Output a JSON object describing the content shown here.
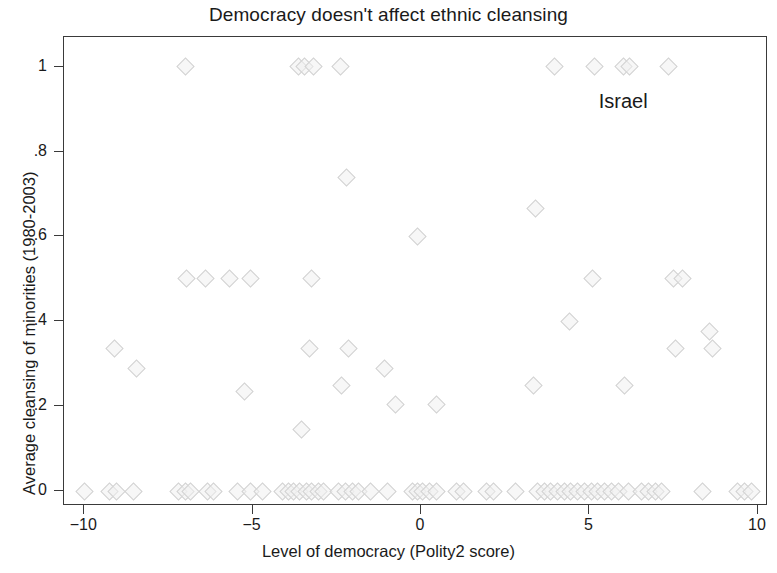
{
  "chart_data": {
    "type": "scatter",
    "title": "Democracy doesn't affect ethnic cleansing",
    "xlabel": "Level of democracy (Polity2 score)",
    "ylabel": "Average cleansing of minorities (1980-2003)",
    "xlim": [
      -10.6,
      10.3
    ],
    "ylim": [
      -0.035,
      1.07
    ],
    "xticks": [
      -10,
      -5,
      0,
      5,
      10
    ],
    "xticklabels": [
      "−10",
      "−5",
      "0",
      "5",
      "10"
    ],
    "yticks": [
      0,
      0.2,
      0.4,
      0.6,
      0.8,
      1
    ],
    "yticklabels": [
      "0",
      ".2",
      ".4",
      ".6",
      ".8",
      "1"
    ],
    "grid": false,
    "legend": null,
    "marker": "diamond",
    "marker_color": "#d2d2d2",
    "annotations": [
      {
        "text": "Israel",
        "x": 6.0,
        "y": 0.92
      }
    ],
    "points": [
      {
        "x": -7.0,
        "y": 1.0
      },
      {
        "x": -3.65,
        "y": 1.0
      },
      {
        "x": -3.45,
        "y": 1.0
      },
      {
        "x": -3.2,
        "y": 1.0
      },
      {
        "x": -2.4,
        "y": 1.0
      },
      {
        "x": 3.95,
        "y": 1.0
      },
      {
        "x": 5.15,
        "y": 1.0
      },
      {
        "x": 6.0,
        "y": 1.0
      },
      {
        "x": 6.2,
        "y": 1.0
      },
      {
        "x": 7.35,
        "y": 1.0
      },
      {
        "x": -2.2,
        "y": 0.74
      },
      {
        "x": 3.4,
        "y": 0.665
      },
      {
        "x": -0.1,
        "y": 0.6
      },
      {
        "x": -6.95,
        "y": 0.5
      },
      {
        "x": -6.4,
        "y": 0.5
      },
      {
        "x": -5.7,
        "y": 0.5
      },
      {
        "x": -5.05,
        "y": 0.5
      },
      {
        "x": -3.25,
        "y": 0.5
      },
      {
        "x": 5.1,
        "y": 0.5
      },
      {
        "x": 7.5,
        "y": 0.5
      },
      {
        "x": 7.75,
        "y": 0.5
      },
      {
        "x": 4.4,
        "y": 0.4
      },
      {
        "x": 8.55,
        "y": 0.375
      },
      {
        "x": -9.1,
        "y": 0.335
      },
      {
        "x": -3.3,
        "y": 0.335
      },
      {
        "x": -2.15,
        "y": 0.335
      },
      {
        "x": 7.55,
        "y": 0.335
      },
      {
        "x": 8.65,
        "y": 0.335
      },
      {
        "x": -8.45,
        "y": 0.29
      },
      {
        "x": -1.1,
        "y": 0.29
      },
      {
        "x": -2.35,
        "y": 0.25
      },
      {
        "x": 3.35,
        "y": 0.25
      },
      {
        "x": 6.05,
        "y": 0.25
      },
      {
        "x": -5.25,
        "y": 0.235
      },
      {
        "x": -0.75,
        "y": 0.205
      },
      {
        "x": 0.45,
        "y": 0.205
      },
      {
        "x": -3.55,
        "y": 0.145
      },
      {
        "x": -10.0,
        "y": 0.0
      },
      {
        "x": -9.25,
        "y": 0.0
      },
      {
        "x": -9.05,
        "y": 0.0
      },
      {
        "x": -8.55,
        "y": 0.0
      },
      {
        "x": -7.2,
        "y": 0.0
      },
      {
        "x": -7.0,
        "y": 0.0
      },
      {
        "x": -6.85,
        "y": 0.0
      },
      {
        "x": -6.35,
        "y": 0.0
      },
      {
        "x": -6.15,
        "y": 0.0
      },
      {
        "x": -5.45,
        "y": 0.0
      },
      {
        "x": -5.05,
        "y": 0.0
      },
      {
        "x": -4.7,
        "y": 0.0
      },
      {
        "x": -4.1,
        "y": 0.0
      },
      {
        "x": -3.95,
        "y": 0.0
      },
      {
        "x": -3.8,
        "y": 0.0
      },
      {
        "x": -3.6,
        "y": 0.0
      },
      {
        "x": -3.4,
        "y": 0.0
      },
      {
        "x": -3.25,
        "y": 0.0
      },
      {
        "x": -3.05,
        "y": 0.0
      },
      {
        "x": -2.9,
        "y": 0.0
      },
      {
        "x": -2.45,
        "y": 0.0
      },
      {
        "x": -2.25,
        "y": 0.0
      },
      {
        "x": -2.05,
        "y": 0.0
      },
      {
        "x": -1.85,
        "y": 0.0
      },
      {
        "x": -1.5,
        "y": 0.0
      },
      {
        "x": -1.0,
        "y": 0.0
      },
      {
        "x": -0.25,
        "y": 0.0
      },
      {
        "x": -0.1,
        "y": 0.0
      },
      {
        "x": 0.05,
        "y": 0.0
      },
      {
        "x": 0.25,
        "y": 0.0
      },
      {
        "x": 0.45,
        "y": 0.0
      },
      {
        "x": 1.05,
        "y": 0.0
      },
      {
        "x": 1.25,
        "y": 0.0
      },
      {
        "x": 1.95,
        "y": 0.0
      },
      {
        "x": 2.15,
        "y": 0.0
      },
      {
        "x": 2.8,
        "y": 0.0
      },
      {
        "x": 3.45,
        "y": 0.0
      },
      {
        "x": 3.65,
        "y": 0.0
      },
      {
        "x": 3.85,
        "y": 0.0
      },
      {
        "x": 4.05,
        "y": 0.0
      },
      {
        "x": 4.25,
        "y": 0.0
      },
      {
        "x": 4.45,
        "y": 0.0
      },
      {
        "x": 4.65,
        "y": 0.0
      },
      {
        "x": 4.85,
        "y": 0.0
      },
      {
        "x": 5.05,
        "y": 0.0
      },
      {
        "x": 5.25,
        "y": 0.0
      },
      {
        "x": 5.45,
        "y": 0.0
      },
      {
        "x": 5.65,
        "y": 0.0
      },
      {
        "x": 5.85,
        "y": 0.0
      },
      {
        "x": 6.15,
        "y": 0.0
      },
      {
        "x": 6.55,
        "y": 0.0
      },
      {
        "x": 6.75,
        "y": 0.0
      },
      {
        "x": 6.95,
        "y": 0.0
      },
      {
        "x": 7.15,
        "y": 0.0
      },
      {
        "x": 8.35,
        "y": 0.0
      },
      {
        "x": 9.4,
        "y": 0.0
      },
      {
        "x": 9.6,
        "y": 0.0
      },
      {
        "x": 9.8,
        "y": 0.0
      }
    ]
  }
}
